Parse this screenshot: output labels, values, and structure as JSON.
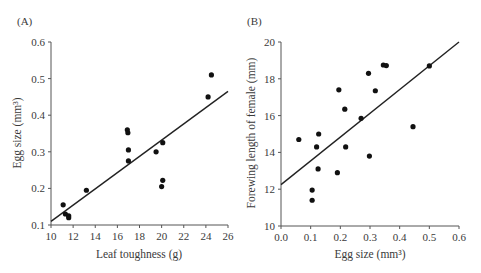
{
  "chart_data": [
    {
      "type": "scatter",
      "panel_label": "(A)",
      "title": "",
      "xlabel": "Leaf toughness (g)",
      "ylabel": "Egg size (mm³)",
      "xlim": [
        10,
        26
      ],
      "ylim": [
        0.1,
        0.6
      ],
      "xticks": [
        "10",
        "12",
        "14",
        "16",
        "18",
        "20",
        "22",
        "24",
        "26"
      ],
      "yticks": [
        "0.1",
        "0.2",
        "0.3",
        "0.4",
        "0.5",
        "0.6"
      ],
      "grid": false,
      "points": [
        {
          "x": 11.1,
          "y": 0.155
        },
        {
          "x": 11.3,
          "y": 0.13
        },
        {
          "x": 11.6,
          "y": 0.125
        },
        {
          "x": 11.6,
          "y": 0.12
        },
        {
          "x": 13.2,
          "y": 0.195
        },
        {
          "x": 16.9,
          "y": 0.36
        },
        {
          "x": 16.95,
          "y": 0.352
        },
        {
          "x": 17.0,
          "y": 0.305
        },
        {
          "x": 17.0,
          "y": 0.275
        },
        {
          "x": 19.5,
          "y": 0.3
        },
        {
          "x": 20.1,
          "y": 0.325
        },
        {
          "x": 20.1,
          "y": 0.222
        },
        {
          "x": 20.0,
          "y": 0.205
        },
        {
          "x": 24.2,
          "y": 0.45
        },
        {
          "x": 24.5,
          "y": 0.51
        }
      ],
      "trendline": {
        "x1": 10,
        "y1": 0.11,
        "x2": 26,
        "y2": 0.465
      }
    },
    {
      "type": "scatter",
      "panel_label": "(B)",
      "title": "",
      "xlabel": "Egg size (mm³)",
      "ylabel": "Forewing length of female (mm)",
      "xlim": [
        0.0,
        0.6
      ],
      "ylim": [
        10,
        20
      ],
      "xticks": [
        "0.0",
        "0.1",
        "0.2",
        "0.3",
        "0.4",
        "0.5",
        "0.6"
      ],
      "yticks": [
        "10",
        "12",
        "14",
        "16",
        "18",
        "20"
      ],
      "grid": false,
      "points": [
        {
          "x": 0.06,
          "y": 14.7
        },
        {
          "x": 0.105,
          "y": 11.95
        },
        {
          "x": 0.105,
          "y": 11.4
        },
        {
          "x": 0.12,
          "y": 14.3
        },
        {
          "x": 0.127,
          "y": 15.0
        },
        {
          "x": 0.125,
          "y": 13.1
        },
        {
          "x": 0.19,
          "y": 12.9
        },
        {
          "x": 0.195,
          "y": 17.4
        },
        {
          "x": 0.215,
          "y": 16.35
        },
        {
          "x": 0.218,
          "y": 14.3
        },
        {
          "x": 0.27,
          "y": 15.85
        },
        {
          "x": 0.295,
          "y": 18.3
        },
        {
          "x": 0.298,
          "y": 13.8
        },
        {
          "x": 0.318,
          "y": 17.35
        },
        {
          "x": 0.345,
          "y": 18.75
        },
        {
          "x": 0.355,
          "y": 18.72
        },
        {
          "x": 0.445,
          "y": 15.4
        },
        {
          "x": 0.5,
          "y": 18.7
        }
      ],
      "trendline": {
        "x1": 0.0,
        "y1": 12.25,
        "x2": 0.6,
        "y2": 20.0
      }
    }
  ],
  "colors": {
    "points": "#111111",
    "axis": "#555555",
    "text": "#3a3a3a"
  }
}
